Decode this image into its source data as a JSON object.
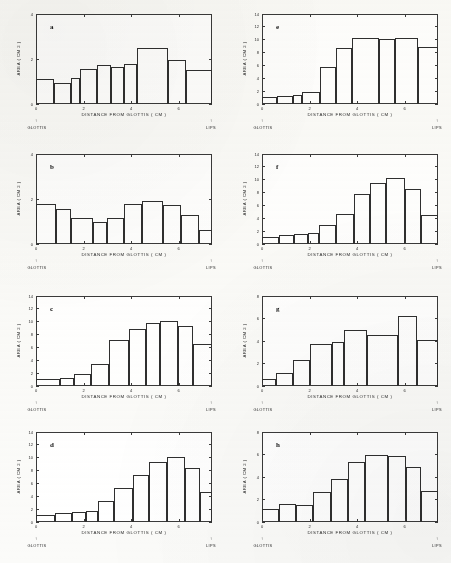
{
  "figure": {
    "width": 451,
    "height": 563,
    "background_color": "#fbfbf9",
    "ink_color": "#2f2f2f",
    "panel_count": 8
  },
  "labels": {
    "xlabel": "DISTANCE FROM GLOTTIS   ( CM )",
    "ylabel": "AREA ( CM 2 )",
    "left_end_label": "GLOTTIS",
    "right_end_label": "LIPS",
    "arrow_glyph": "↑"
  },
  "chart_data": [
    {
      "id": "a",
      "type": "bar",
      "title": "a",
      "xlabel": "DISTANCE FROM GLOTTIS   ( CM )",
      "ylabel": "AREA ( CM 2 )",
      "xlim": [
        0,
        7.4
      ],
      "ylim": [
        0,
        4
      ],
      "yticks": [
        0,
        2,
        4
      ],
      "xticks": [
        0,
        2,
        4,
        6
      ],
      "grid": false,
      "legend": null,
      "categories": [
        0.37,
        1.11,
        1.85,
        2.22,
        2.96,
        3.33,
        3.89,
        4.81,
        5.55,
        6.66
      ],
      "values": [
        1.1,
        0.95,
        1.15,
        1.55,
        1.75,
        1.65,
        1.75,
        2.5,
        1.95,
        1.5
      ],
      "bar_spans": [
        {
          "x0": 0.0,
          "x1": 0.75,
          "y": 1.1
        },
        {
          "x0": 0.75,
          "x1": 1.48,
          "y": 0.95
        },
        {
          "x0": 1.48,
          "x1": 1.85,
          "y": 1.15
        },
        {
          "x0": 1.85,
          "x1": 2.58,
          "y": 1.55
        },
        {
          "x0": 2.58,
          "x1": 3.15,
          "y": 1.75
        },
        {
          "x0": 3.15,
          "x1": 3.7,
          "y": 1.65
        },
        {
          "x0": 3.7,
          "x1": 4.25,
          "y": 1.78
        },
        {
          "x0": 4.25,
          "x1": 5.55,
          "y": 2.5
        },
        {
          "x0": 5.55,
          "x1": 6.3,
          "y": 1.95
        },
        {
          "x0": 6.3,
          "x1": 7.4,
          "y": 1.5
        }
      ]
    },
    {
      "id": "b",
      "type": "bar",
      "title": "b",
      "xlabel": "DISTANCE FROM GLOTTIS   ( CM )",
      "ylabel": "AREA ( CM 2 )",
      "xlim": [
        0,
        7.4
      ],
      "ylim": [
        0,
        4
      ],
      "yticks": [
        0,
        2,
        4
      ],
      "xticks": [
        0,
        2,
        4,
        6
      ],
      "grid": false,
      "legend": null,
      "categories": [
        0.37,
        1.11,
        1.85,
        2.59,
        3.15,
        3.89,
        4.62,
        5.36,
        6.1,
        7.0
      ],
      "values": [
        1.8,
        1.55,
        1.15,
        1.0,
        1.15,
        1.8,
        1.9,
        1.75,
        1.3,
        0.62
      ],
      "bar_spans": [
        {
          "x0": 0.0,
          "x1": 0.82,
          "y": 1.8
        },
        {
          "x0": 0.82,
          "x1": 1.48,
          "y": 1.55
        },
        {
          "x0": 1.48,
          "x1": 2.4,
          "y": 1.15
        },
        {
          "x0": 2.4,
          "x1": 3.0,
          "y": 1.0
        },
        {
          "x0": 3.0,
          "x1": 3.7,
          "y": 1.15
        },
        {
          "x0": 3.7,
          "x1": 4.44,
          "y": 1.8
        },
        {
          "x0": 4.44,
          "x1": 5.36,
          "y": 1.9
        },
        {
          "x0": 5.36,
          "x1": 6.1,
          "y": 1.75
        },
        {
          "x0": 6.1,
          "x1": 6.85,
          "y": 1.3
        },
        {
          "x0": 6.85,
          "x1": 7.4,
          "y": 0.62
        }
      ]
    },
    {
      "id": "c",
      "type": "bar",
      "title": "c",
      "xlabel": "DISTANCE FROM GLOTTIS   ( CM )",
      "ylabel": "AREA ( CM 2 )",
      "xlim": [
        0,
        7.4
      ],
      "ylim": [
        0,
        14
      ],
      "yticks": [
        0,
        2,
        4,
        6,
        8,
        10,
        12,
        14
      ],
      "xticks": [
        0,
        2,
        4,
        6
      ],
      "grid": false,
      "legend": null,
      "categories": [
        0.37,
        1.11,
        1.85,
        2.4,
        3.15,
        3.89,
        4.62,
        5.36,
        6.1,
        7.0
      ],
      "values": [
        1.15,
        1.3,
        1.85,
        3.5,
        7.2,
        8.85,
        9.85,
        10.05,
        9.4,
        6.55
      ],
      "bar_spans": [
        {
          "x0": 0.0,
          "x1": 1.0,
          "y": 1.15
        },
        {
          "x0": 1.0,
          "x1": 1.6,
          "y": 1.3
        },
        {
          "x0": 1.6,
          "x1": 2.3,
          "y": 1.85
        },
        {
          "x0": 2.3,
          "x1": 3.05,
          "y": 3.5
        },
        {
          "x0": 3.05,
          "x1": 3.9,
          "y": 7.2
        },
        {
          "x0": 3.9,
          "x1": 4.62,
          "y": 8.85
        },
        {
          "x0": 4.62,
          "x1": 5.2,
          "y": 9.85
        },
        {
          "x0": 5.2,
          "x1": 5.95,
          "y": 10.05
        },
        {
          "x0": 5.95,
          "x1": 6.6,
          "y": 9.4
        },
        {
          "x0": 6.6,
          "x1": 7.4,
          "y": 6.55
        }
      ]
    },
    {
      "id": "d",
      "type": "bar",
      "title": "d",
      "xlabel": "DISTANCE FROM GLOTTIS   ( CM )",
      "ylabel": "AREA ( CM 2 )",
      "xlim": [
        0,
        7.4
      ],
      "ylim": [
        0,
        14
      ],
      "yticks": [
        0,
        2,
        4,
        6,
        8,
        10,
        12,
        14
      ],
      "xticks": [
        0,
        2,
        4,
        6
      ],
      "grid": false,
      "legend": null,
      "categories": [
        0.37,
        1.11,
        1.85,
        2.59,
        3.33,
        4.07,
        4.81,
        5.55,
        6.29,
        7.05
      ],
      "values": [
        1.05,
        1.45,
        1.6,
        1.75,
        3.25,
        5.25,
        7.35,
        9.4,
        10.1,
        8.45
      ],
      "bar_spans": [
        {
          "x0": 0.0,
          "x1": 0.8,
          "y": 1.05
        },
        {
          "x0": 0.8,
          "x1": 1.52,
          "y": 1.45
        },
        {
          "x0": 1.52,
          "x1": 2.1,
          "y": 1.6
        },
        {
          "x0": 2.1,
          "x1": 2.62,
          "y": 1.75
        },
        {
          "x0": 2.62,
          "x1": 3.3,
          "y": 3.25
        },
        {
          "x0": 3.3,
          "x1": 4.07,
          "y": 5.25
        },
        {
          "x0": 4.07,
          "x1": 4.75,
          "y": 7.35
        },
        {
          "x0": 4.75,
          "x1": 5.5,
          "y": 9.4
        },
        {
          "x0": 5.5,
          "x1": 6.25,
          "y": 10.1
        },
        {
          "x0": 6.25,
          "x1": 6.9,
          "y": 8.45
        },
        {
          "x0": 6.9,
          "x1": 7.4,
          "y": 4.65
        }
      ]
    },
    {
      "id": "e",
      "type": "bar",
      "title": "e",
      "xlabel": "DISTANCE FROM GLOTTIS   ( CM )",
      "ylabel": "AREA ( CM 2 )",
      "xlim": [
        0,
        7.4
      ],
      "ylim": [
        0,
        14
      ],
      "yticks": [
        0,
        2,
        4,
        6,
        8,
        10,
        12,
        14
      ],
      "xticks": [
        0,
        2,
        4,
        6
      ],
      "grid": false,
      "legend": null,
      "categories": [
        0.37,
        1.11,
        1.85,
        2.4,
        3.15,
        3.89,
        4.62,
        5.36,
        6.1,
        7.0
      ],
      "values": [
        1.1,
        1.3,
        1.45,
        1.8,
        5.7,
        8.7,
        10.2,
        10.15,
        10.2,
        8.8
      ],
      "bar_spans": [
        {
          "x0": 0.0,
          "x1": 0.62,
          "y": 1.1
        },
        {
          "x0": 0.62,
          "x1": 1.3,
          "y": 1.3
        },
        {
          "x0": 1.3,
          "x1": 1.7,
          "y": 1.45
        },
        {
          "x0": 1.7,
          "x1": 2.45,
          "y": 1.8
        },
        {
          "x0": 2.45,
          "x1": 3.1,
          "y": 5.7
        },
        {
          "x0": 3.1,
          "x1": 3.8,
          "y": 8.7
        },
        {
          "x0": 3.8,
          "x1": 4.9,
          "y": 10.2
        },
        {
          "x0": 4.9,
          "x1": 5.6,
          "y": 10.1
        },
        {
          "x0": 5.6,
          "x1": 6.55,
          "y": 10.2
        },
        {
          "x0": 6.55,
          "x1": 7.4,
          "y": 8.8
        }
      ]
    },
    {
      "id": "f",
      "type": "bar",
      "title": "f",
      "xlabel": "DISTANCE FROM GLOTTIS   ( CM )",
      "ylabel": "AREA ( CM 2 )",
      "xlim": [
        0,
        7.4
      ],
      "ylim": [
        0,
        14
      ],
      "yticks": [
        0,
        2,
        4,
        6,
        8,
        10,
        12,
        14
      ],
      "xticks": [
        0,
        2,
        4,
        6
      ],
      "grid": false,
      "legend": null,
      "categories": [
        0.37,
        1.11,
        1.85,
        2.59,
        3.33,
        4.07,
        4.81,
        5.55,
        6.29,
        7.05
      ],
      "values": [
        1.1,
        1.45,
        1.6,
        1.75,
        2.9,
        4.6,
        7.8,
        9.45,
        10.3,
        8.6
      ],
      "bar_spans": [
        {
          "x0": 0.0,
          "x1": 0.7,
          "y": 1.1
        },
        {
          "x0": 0.7,
          "x1": 1.35,
          "y": 1.45
        },
        {
          "x0": 1.35,
          "x1": 1.95,
          "y": 1.62
        },
        {
          "x0": 1.95,
          "x1": 2.4,
          "y": 1.72
        },
        {
          "x0": 2.4,
          "x1": 3.1,
          "y": 2.9
        },
        {
          "x0": 3.1,
          "x1": 3.85,
          "y": 4.6
        },
        {
          "x0": 3.85,
          "x1": 4.55,
          "y": 7.8
        },
        {
          "x0": 4.55,
          "x1": 5.2,
          "y": 9.45
        },
        {
          "x0": 5.2,
          "x1": 6.0,
          "y": 10.3
        },
        {
          "x0": 6.0,
          "x1": 6.7,
          "y": 8.6
        },
        {
          "x0": 6.7,
          "x1": 7.4,
          "y": 4.45
        }
      ]
    },
    {
      "id": "g",
      "type": "bar",
      "title": "g",
      "xlabel": "DISTANCE FROM GLOTTIS   ( CM )",
      "ylabel": "AREA ( CM 2 )",
      "xlim": [
        0,
        7.4
      ],
      "ylim": [
        0,
        8
      ],
      "yticks": [
        0,
        2,
        4,
        6,
        8
      ],
      "xticks": [
        0,
        2,
        4,
        6
      ],
      "grid": false,
      "legend": null,
      "categories": [
        0.37,
        1.11,
        1.85,
        2.59,
        3.33,
        4.07,
        4.81,
        5.55,
        6.29,
        7.05
      ],
      "values": [
        0.62,
        1.15,
        2.35,
        3.75,
        3.95,
        5.0,
        4.5,
        6.25,
        4.05,
        4.05
      ],
      "bar_spans": [
        {
          "x0": 0.0,
          "x1": 0.6,
          "y": 0.62
        },
        {
          "x0": 0.6,
          "x1": 1.3,
          "y": 1.15
        },
        {
          "x0": 1.3,
          "x1": 2.0,
          "y": 2.35
        },
        {
          "x0": 2.0,
          "x1": 2.95,
          "y": 3.75
        },
        {
          "x0": 2.95,
          "x1": 3.45,
          "y": 3.95
        },
        {
          "x0": 3.45,
          "x1": 4.4,
          "y": 5.0
        },
        {
          "x0": 4.4,
          "x1": 5.7,
          "y": 4.5
        },
        {
          "x0": 5.7,
          "x1": 6.5,
          "y": 6.25
        },
        {
          "x0": 6.5,
          "x1": 7.4,
          "y": 4.05
        }
      ]
    },
    {
      "id": "h",
      "type": "bar",
      "title": "h",
      "xlabel": "DISTANCE FROM GLOTTIS   ( CM )",
      "ylabel": "AREA ( CM 2 )",
      "xlim": [
        0,
        7.4
      ],
      "ylim": [
        0,
        8
      ],
      "yticks": [
        0,
        2,
        4,
        6,
        8
      ],
      "xticks": [
        0,
        2,
        4,
        6
      ],
      "grid": false,
      "legend": null,
      "categories": [
        0.37,
        1.11,
        1.85,
        2.59,
        3.33,
        4.07,
        4.81,
        5.55,
        6.29,
        7.05
      ],
      "values": [
        1.2,
        1.6,
        1.55,
        2.7,
        3.8,
        5.3,
        6.0,
        5.9,
        4.9,
        2.75
      ],
      "bar_spans": [
        {
          "x0": 0.0,
          "x1": 0.72,
          "y": 1.2
        },
        {
          "x0": 0.72,
          "x1": 1.45,
          "y": 1.62
        },
        {
          "x0": 1.45,
          "x1": 2.15,
          "y": 1.55
        },
        {
          "x0": 2.15,
          "x1": 2.9,
          "y": 2.7
        },
        {
          "x0": 2.9,
          "x1": 3.6,
          "y": 3.8
        },
        {
          "x0": 3.6,
          "x1": 4.35,
          "y": 5.3
        },
        {
          "x0": 4.35,
          "x1": 5.3,
          "y": 6.0
        },
        {
          "x0": 5.3,
          "x1": 6.05,
          "y": 5.9
        },
        {
          "x0": 6.05,
          "x1": 6.7,
          "y": 4.9
        },
        {
          "x0": 6.7,
          "x1": 7.4,
          "y": 2.75
        }
      ]
    }
  ],
  "panel_positions": [
    {
      "id": "a",
      "left": 6,
      "top": 8
    },
    {
      "id": "e",
      "left": 232,
      "top": 8
    },
    {
      "id": "b",
      "left": 6,
      "top": 148
    },
    {
      "id": "f",
      "left": 232,
      "top": 148
    },
    {
      "id": "c",
      "left": 6,
      "top": 290
    },
    {
      "id": "g",
      "left": 232,
      "top": 290
    },
    {
      "id": "d",
      "left": 6,
      "top": 426
    },
    {
      "id": "h",
      "left": 232,
      "top": 426
    }
  ]
}
